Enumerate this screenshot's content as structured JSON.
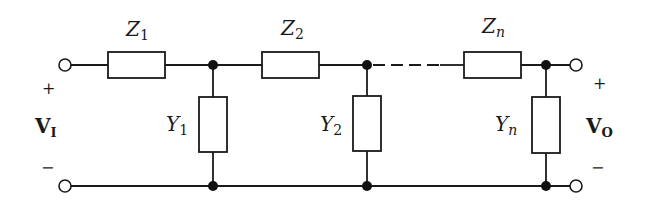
{
  "diagram": {
    "series_impedances": [
      {
        "symbol": "Z",
        "subscript": "1"
      },
      {
        "symbol": "Z",
        "subscript": "2"
      },
      {
        "symbol": "Z",
        "subscript": "n"
      }
    ],
    "shunt_admittances": [
      {
        "symbol": "Y",
        "subscript": "1"
      },
      {
        "symbol": "Y",
        "subscript": "2"
      },
      {
        "symbol": "Y",
        "subscript": "n"
      }
    ],
    "input": {
      "symbol": "V",
      "subscript": "I",
      "plus": "+",
      "minus": "−"
    },
    "output": {
      "symbol": "V",
      "subscript": "O",
      "plus": "+",
      "minus": "−"
    }
  }
}
